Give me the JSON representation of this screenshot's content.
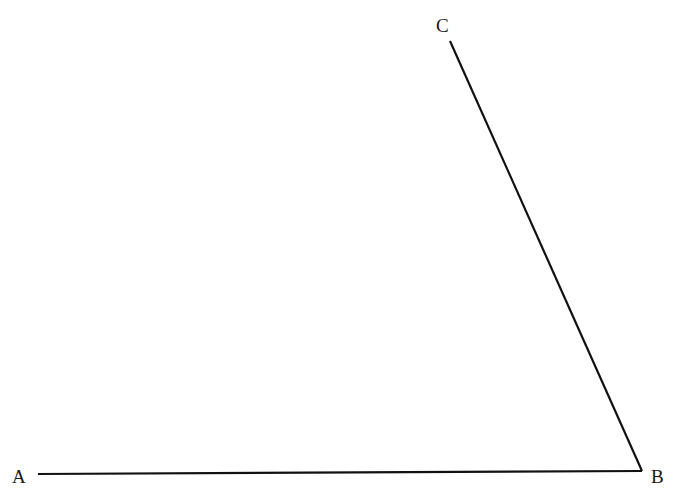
{
  "diagram": {
    "type": "angle",
    "stroke_color": "#111111",
    "background": "#ffffff",
    "points": {
      "A": {
        "label": "A",
        "x": 38,
        "y": 474
      },
      "B": {
        "label": "B",
        "x": 642,
        "y": 471
      },
      "C": {
        "label": "C",
        "x": 450,
        "y": 41
      }
    },
    "segments": [
      {
        "id": "AB",
        "from": "A",
        "to": "B"
      },
      {
        "id": "BC",
        "from": "B",
        "to": "C"
      }
    ],
    "label_positions": {
      "A": {
        "left": 12,
        "top": 467
      },
      "B": {
        "left": 651,
        "top": 467
      },
      "C": {
        "left": 436,
        "top": 16
      }
    }
  }
}
